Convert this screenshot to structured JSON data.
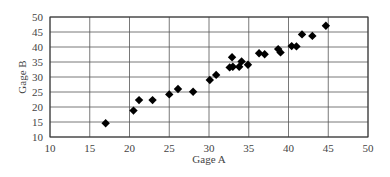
{
  "chart_data": {
    "type": "scatter",
    "title": "",
    "xlabel": "Gage A",
    "ylabel": "Gage B",
    "xlim": [
      10,
      50
    ],
    "ylim": [
      10,
      50
    ],
    "xticks": [
      10,
      15,
      20,
      25,
      30,
      35,
      40,
      45,
      50
    ],
    "yticks": [
      10,
      15,
      20,
      25,
      30,
      35,
      40,
      45,
      50
    ],
    "grid": true,
    "legend": null,
    "marker": "diamond",
    "marker_color": "#000000",
    "series": [
      {
        "name": "Gage A vs Gage B",
        "points": [
          [
            17.0,
            14.6
          ],
          [
            20.5,
            18.8
          ],
          [
            21.2,
            22.3
          ],
          [
            22.9,
            22.3
          ],
          [
            25.0,
            24.2
          ],
          [
            26.1,
            26.0
          ],
          [
            28.0,
            25.1
          ],
          [
            30.1,
            29.0
          ],
          [
            30.9,
            30.7
          ],
          [
            32.6,
            33.2
          ],
          [
            32.9,
            36.6
          ],
          [
            33.0,
            33.4
          ],
          [
            33.8,
            33.4
          ],
          [
            34.1,
            35.2
          ],
          [
            34.9,
            34.1
          ],
          [
            36.3,
            37.9
          ],
          [
            37.0,
            37.6
          ],
          [
            38.7,
            39.3
          ],
          [
            39.0,
            38.2
          ],
          [
            40.4,
            40.3
          ],
          [
            41.0,
            40.2
          ],
          [
            41.7,
            44.2
          ],
          [
            43.0,
            43.7
          ],
          [
            44.7,
            47.1
          ]
        ]
      }
    ]
  }
}
